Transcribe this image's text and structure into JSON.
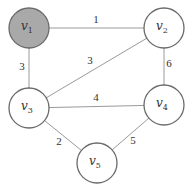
{
  "graph": {
    "nodes": [
      {
        "id": "v1",
        "base": "v",
        "sub": "1",
        "x": 29,
        "y": 28,
        "r": 20,
        "fill": "#a9a9a9"
      },
      {
        "id": "v2",
        "base": "v",
        "sub": "2",
        "x": 164,
        "y": 28,
        "r": 20,
        "fill": "#ffffff"
      },
      {
        "id": "v3",
        "base": "v",
        "sub": "3",
        "x": 29,
        "y": 108,
        "r": 20,
        "fill": "#ffffff"
      },
      {
        "id": "v4",
        "base": "v",
        "sub": "4",
        "x": 164,
        "y": 105,
        "r": 20,
        "fill": "#ffffff"
      },
      {
        "id": "v5",
        "base": "v",
        "sub": "5",
        "x": 97,
        "y": 163,
        "r": 20,
        "fill": "#ffffff"
      }
    ],
    "edges": [
      {
        "from": "v1",
        "to": "v2",
        "weight": "1",
        "lx": 96,
        "ly": 23
      },
      {
        "from": "v1",
        "to": "v3",
        "weight": "3",
        "lx": 22,
        "ly": 70
      },
      {
        "from": "v2",
        "to": "v3",
        "weight": "3",
        "lx": 90,
        "ly": 64
      },
      {
        "from": "v2",
        "to": "v4",
        "weight": "6",
        "lx": 169,
        "ly": 67
      },
      {
        "from": "v3",
        "to": "v4",
        "weight": "4",
        "lx": 96,
        "ly": 101
      },
      {
        "from": "v3",
        "to": "v5",
        "weight": "2",
        "lx": 59,
        "ly": 145
      },
      {
        "from": "v4",
        "to": "v5",
        "weight": "5",
        "lx": 133,
        "ly": 144
      }
    ]
  }
}
